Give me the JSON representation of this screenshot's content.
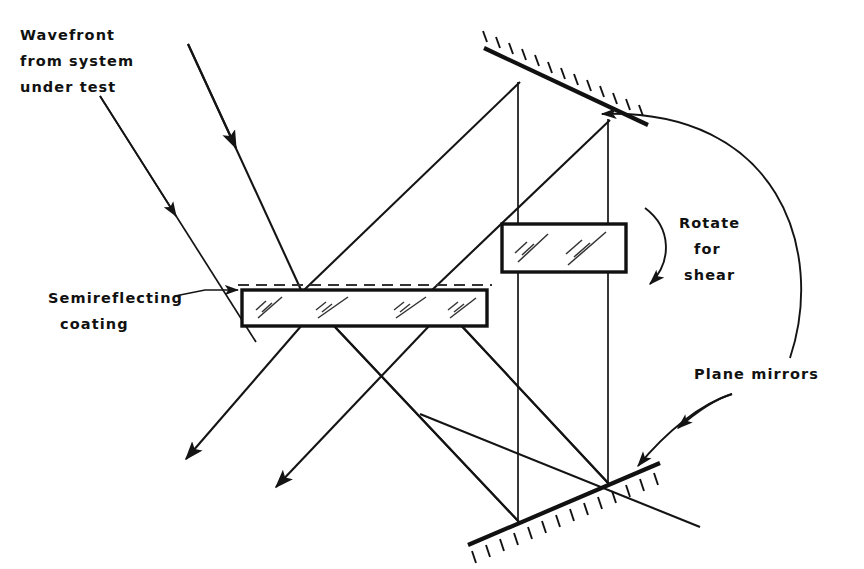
{
  "figure": {
    "background_color": "#ffffff",
    "line_color": "#141414",
    "width": 864,
    "height": 569
  },
  "labels": {
    "wavefront": {
      "line1": "Wavefront",
      "line2": "from system",
      "line3": "under test"
    },
    "semireflecting": {
      "line1": "Semireflecting",
      "line2": "coating"
    },
    "rotate": {
      "line1": "Rotate",
      "line2": "for",
      "line3": "shear"
    },
    "plane_mirrors": {
      "line1": "Plane mirrors"
    }
  },
  "components": {
    "beamsplitter": {
      "name": "beamsplitter-plate",
      "coating_side": "top"
    },
    "shear_plate": {
      "name": "shear-plate"
    },
    "top_mirror": {
      "name": "plane-mirror-top",
      "hatch_side": "above"
    },
    "bottom_mirror": {
      "name": "plane-mirror-bottom",
      "hatch_side": "below"
    }
  },
  "colors": {
    "ink": "#141414",
    "coating": "#333333",
    "paper": "#ffffff"
  }
}
